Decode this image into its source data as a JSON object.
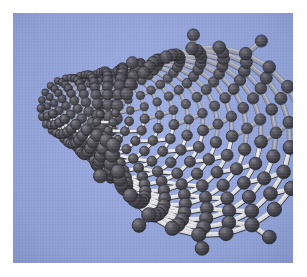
{
  "figure": {
    "caption": ""
  },
  "canvas": {
    "width": 307,
    "height": 277,
    "border_color": "#ffffff",
    "border_px": 13,
    "plate": {
      "x": 13,
      "y": 13,
      "width": 280,
      "height": 250
    }
  },
  "colors": {
    "page_background": "#ffffff",
    "plate_background": "#9aabe2",
    "plate_background_shade": "#8d9fd8",
    "atom_fill": "#4c4a4e",
    "atom_fill_dark": "#2e2c30",
    "atom_highlight": "#7b7880",
    "atom_edge": "#201f23",
    "bond_light": "#e8e8ea",
    "bond_mid": "#b9bac2",
    "bond_dark": "#3a3a42",
    "bond_shadow": "#23232b"
  },
  "model": {
    "type": "nanotube",
    "chirality": "armchair",
    "ring_atoms": 22,
    "rings_along_axis": 15,
    "open_end": "right",
    "far_end": "left",
    "dangling_bonds": true,
    "bond_length_px": 26,
    "projection": "perspective",
    "camera": {
      "tilt_deg": -14,
      "yaw_deg": 18,
      "focal_length": 300,
      "axis_vanishing_x": 30,
      "axis_vanishing_y": 100
    },
    "geometry": {
      "near_radius_px": 96,
      "far_radius_px": 30,
      "near_center_x": 196,
      "near_center_y": 128,
      "far_center_x": 58,
      "far_center_y": 104,
      "atom_radius_near_px": 7.2,
      "atom_radius_far_px": 2.6,
      "bond_width_near_px": 4.6,
      "bond_width_far_px": 1.3
    }
  },
  "rim": {
    "label": "open end with terminating atoms",
    "terminal_atom_count": 11
  }
}
